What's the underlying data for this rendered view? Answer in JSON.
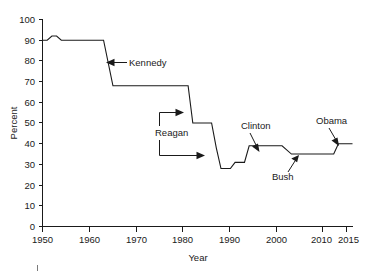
{
  "chart_data": {
    "type": "line",
    "title": "",
    "xlabel": "Year",
    "ylabel": "Percent",
    "xlim": [
      1950,
      2016
    ],
    "ylim": [
      0,
      100
    ],
    "grid": false,
    "legend": null,
    "x_ticks": [
      1950,
      1960,
      1970,
      1980,
      1990,
      2000,
      2010,
      2015
    ],
    "x_tick_labels": [
      "1950",
      "1960",
      "1970",
      "1980",
      "1990",
      "2000",
      "2010",
      "2015"
    ],
    "y_ticks": [
      0,
      10,
      20,
      30,
      40,
      50,
      60,
      70,
      80,
      90,
      100
    ],
    "y_tick_labels": [
      "0",
      "10",
      "20",
      "30",
      "40",
      "50",
      "60",
      "70",
      "80",
      "90",
      "100"
    ],
    "series": [
      {
        "name": "Top marginal tax rate",
        "style": "step",
        "points": [
          {
            "x": 1950,
            "y": 90
          },
          {
            "x": 1951,
            "y": 90
          },
          {
            "x": 1952,
            "y": 92
          },
          {
            "x": 1953,
            "y": 92
          },
          {
            "x": 1954,
            "y": 90
          },
          {
            "x": 1963,
            "y": 90
          },
          {
            "x": 1965,
            "y": 68
          },
          {
            "x": 1981,
            "y": 68
          },
          {
            "x": 1982,
            "y": 50
          },
          {
            "x": 1986,
            "y": 50
          },
          {
            "x": 1987,
            "y": 38
          },
          {
            "x": 1988,
            "y": 28
          },
          {
            "x": 1990,
            "y": 28
          },
          {
            "x": 1991,
            "y": 31
          },
          {
            "x": 1993,
            "y": 31
          },
          {
            "x": 1994,
            "y": 39
          },
          {
            "x": 2000,
            "y": 39
          },
          {
            "x": 2001,
            "y": 39
          },
          {
            "x": 2003,
            "y": 35
          },
          {
            "x": 2012,
            "y": 35
          },
          {
            "x": 2013,
            "y": 40
          },
          {
            "x": 2016,
            "y": 40
          }
        ]
      }
    ],
    "annotations": [
      {
        "label": "Kennedy",
        "text_x": 1975,
        "text_y": 76,
        "point_x": 1964.5,
        "point_y": 76,
        "arrow": "left"
      },
      {
        "label": "Reagan",
        "text_x": 1974,
        "text_y": 45,
        "point_x": 1981.5,
        "point_y": 57,
        "arrow": "right"
      },
      {
        "label": "Clinton",
        "text_x": 1993,
        "text_y": 48,
        "point_x": 1995.5,
        "point_y": 41,
        "arrow": "down-right"
      },
      {
        "label": "Bush",
        "text_x": 1999,
        "text_y": 22,
        "point_x": 2003.5,
        "point_y": 34,
        "arrow": "up-right"
      },
      {
        "label": "Obama",
        "text_x": 2011,
        "text_y": 50,
        "point_x": 2013.5,
        "point_y": 43,
        "arrow": "down-right"
      }
    ]
  },
  "axis": {
    "x_title": "Year",
    "y_title": "Percent"
  }
}
